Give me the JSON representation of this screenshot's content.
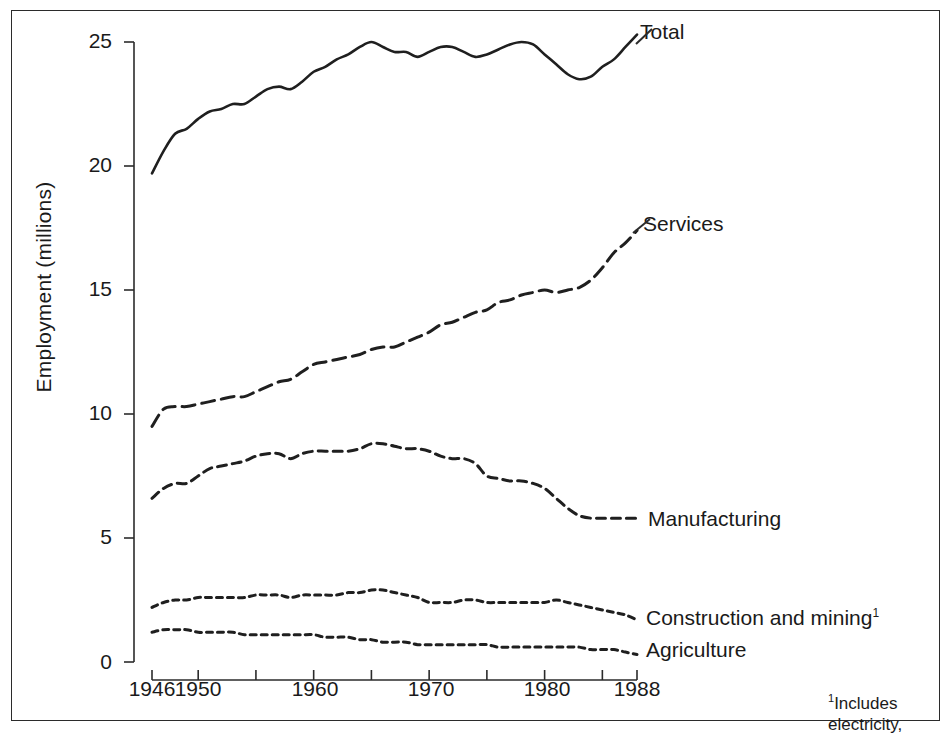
{
  "figure": {
    "background_color": "#ffffff",
    "ink_color": "#1a1a1a"
  },
  "footnote": {
    "marker": "1",
    "line1": "Includes",
    "line2": "electricity,"
  },
  "labels": {
    "total": "Total",
    "services": "Services",
    "manufacturing": "Manufacturing",
    "construction": "Construction and mining",
    "construction_marker": "1",
    "agriculture": "Agriculture"
  },
  "axes": {
    "y_title": "Employment (millions)",
    "y_ticks": [
      "0",
      "5",
      "10",
      "15",
      "20",
      "25"
    ],
    "x_ticks": [
      "1946",
      "1950",
      "1960",
      "1970",
      "1980",
      "1988"
    ]
  },
  "chart_data": {
    "type": "line",
    "title": "",
    "xlabel": "",
    "ylabel": "Employment (millions)",
    "xlim": [
      1946,
      1988
    ],
    "ylim": [
      0,
      25
    ],
    "grid": false,
    "legend_position": "inline-right-of-series",
    "x_tick_labels": [
      "1946",
      "1950",
      "1960",
      "1970",
      "1980",
      "1988"
    ],
    "x_minor_tick_years": [
      1946,
      1950,
      1955,
      1960,
      1965,
      1970,
      1975,
      1980,
      1985,
      1988
    ],
    "y_tick_labels": [
      "0",
      "5",
      "10",
      "15",
      "20",
      "25"
    ],
    "x": [
      1946,
      1947,
      1948,
      1949,
      1950,
      1951,
      1952,
      1953,
      1954,
      1955,
      1956,
      1957,
      1958,
      1959,
      1960,
      1961,
      1962,
      1963,
      1964,
      1965,
      1966,
      1967,
      1968,
      1969,
      1970,
      1971,
      1972,
      1973,
      1974,
      1975,
      1976,
      1977,
      1978,
      1979,
      1980,
      1981,
      1982,
      1983,
      1984,
      1985,
      1986,
      1987,
      1988
    ],
    "series": [
      {
        "name": "Total",
        "line_style": "solid",
        "values": [
          19.7,
          20.6,
          21.3,
          21.5,
          21.9,
          22.2,
          22.3,
          22.5,
          22.5,
          22.8,
          23.1,
          23.2,
          23.1,
          23.4,
          23.8,
          24.0,
          24.3,
          24.5,
          24.8,
          25.0,
          24.8,
          24.6,
          24.6,
          24.4,
          24.6,
          24.8,
          24.8,
          24.6,
          24.4,
          24.5,
          24.7,
          24.9,
          25.0,
          24.9,
          24.5,
          24.1,
          23.7,
          23.5,
          23.6,
          24.0,
          24.3,
          24.8,
          25.3
        ]
      },
      {
        "name": "Services",
        "line_style": "long-dash",
        "values": [
          9.5,
          10.2,
          10.3,
          10.3,
          10.4,
          10.5,
          10.6,
          10.7,
          10.7,
          10.9,
          11.1,
          11.3,
          11.4,
          11.7,
          12.0,
          12.1,
          12.2,
          12.3,
          12.4,
          12.6,
          12.7,
          12.7,
          12.9,
          13.1,
          13.3,
          13.6,
          13.7,
          13.9,
          14.1,
          14.2,
          14.5,
          14.6,
          14.8,
          14.9,
          15.0,
          14.9,
          15.0,
          15.1,
          15.4,
          15.9,
          16.5,
          16.9,
          17.4
        ]
      },
      {
        "name": "Manufacturing",
        "line_style": "medium-dash",
        "values": [
          6.6,
          7.0,
          7.2,
          7.2,
          7.5,
          7.8,
          7.9,
          8.0,
          8.1,
          8.3,
          8.4,
          8.4,
          8.2,
          8.4,
          8.5,
          8.5,
          8.5,
          8.5,
          8.6,
          8.8,
          8.8,
          8.7,
          8.6,
          8.6,
          8.5,
          8.3,
          8.2,
          8.2,
          8.0,
          7.5,
          7.4,
          7.3,
          7.3,
          7.2,
          7.0,
          6.6,
          6.2,
          5.9,
          5.8,
          5.8,
          5.8,
          5.8,
          5.8
        ]
      },
      {
        "name": "Construction and mining",
        "line_style": "short-dash",
        "values": [
          2.2,
          2.4,
          2.5,
          2.5,
          2.6,
          2.6,
          2.6,
          2.6,
          2.6,
          2.7,
          2.7,
          2.7,
          2.6,
          2.7,
          2.7,
          2.7,
          2.7,
          2.8,
          2.8,
          2.9,
          2.9,
          2.8,
          2.7,
          2.6,
          2.4,
          2.4,
          2.4,
          2.5,
          2.5,
          2.4,
          2.4,
          2.4,
          2.4,
          2.4,
          2.4,
          2.5,
          2.4,
          2.3,
          2.2,
          2.1,
          2.0,
          1.9,
          1.7
        ]
      },
      {
        "name": "Agriculture",
        "line_style": "short-dash",
        "values": [
          1.2,
          1.3,
          1.3,
          1.3,
          1.2,
          1.2,
          1.2,
          1.2,
          1.1,
          1.1,
          1.1,
          1.1,
          1.1,
          1.1,
          1.1,
          1.0,
          1.0,
          1.0,
          0.9,
          0.9,
          0.8,
          0.8,
          0.8,
          0.7,
          0.7,
          0.7,
          0.7,
          0.7,
          0.7,
          0.7,
          0.6,
          0.6,
          0.6,
          0.6,
          0.6,
          0.6,
          0.6,
          0.6,
          0.5,
          0.5,
          0.5,
          0.4,
          0.3
        ]
      }
    ]
  }
}
